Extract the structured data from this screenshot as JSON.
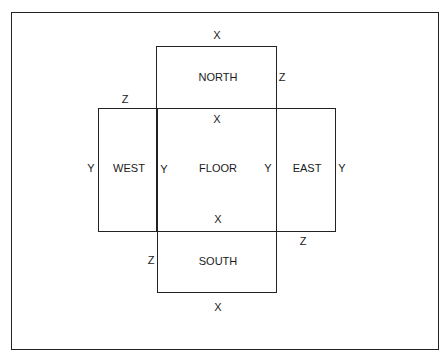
{
  "diagram": {
    "title": "",
    "panels": {
      "north": "NORTH",
      "west": "WEST",
      "floor": "FLOOR",
      "east": "EAST",
      "south": "SOUTH"
    },
    "dimension_labels": {
      "north_top": "X",
      "north_right": "Z",
      "west_top": "Z",
      "floor_top": "X",
      "west_left": "Y",
      "floor_left": "Y",
      "floor_right": "Y",
      "east_right": "Y",
      "floor_bottom": "X",
      "east_bottom": "Z",
      "south_left": "Z",
      "south_bottom": "X"
    },
    "colors": {
      "line": "#222222",
      "text": "#1a1a1a",
      "background": "#ffffff"
    }
  }
}
